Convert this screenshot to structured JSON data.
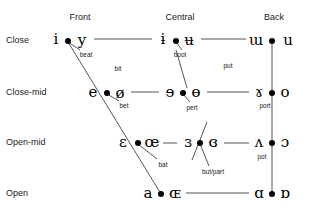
{
  "chart_data": {
    "type": "scatter",
    "xlabel": "",
    "ylabel": "",
    "columns": [
      "Front",
      "Central",
      "Back"
    ],
    "rows": [
      "Close",
      "Close-mid",
      "Open-mid",
      "Open"
    ],
    "points": [
      {
        "row": "Close",
        "column": "Front",
        "unrounded": "i",
        "rounded": "y",
        "gloss": "beat"
      },
      {
        "row": "Close",
        "column": "Central",
        "unrounded": "ɨ",
        "rounded": "ʉ",
        "gloss": "boot"
      },
      {
        "row": "Close",
        "column": "Back",
        "unrounded": "ɯ",
        "rounded": "u",
        "gloss": "put"
      },
      {
        "row": "Close-mid",
        "column": "Front",
        "unrounded": "e",
        "rounded": "ø",
        "gloss": "bet"
      },
      {
        "row": "Close-mid",
        "column": "Central",
        "unrounded": "ɘ",
        "rounded": "ɵ",
        "gloss": "pert"
      },
      {
        "row": "Close-mid",
        "column": "Back",
        "unrounded": "ɤ",
        "rounded": "o",
        "gloss": "port"
      },
      {
        "row": "Open-mid",
        "column": "Front",
        "unrounded": "ɛ",
        "rounded": "œ",
        "gloss": "bat"
      },
      {
        "row": "Open-mid",
        "column": "Central",
        "unrounded": "ɜ",
        "rounded": "ɞ",
        "gloss": "but/part"
      },
      {
        "row": "Open-mid",
        "column": "Back",
        "unrounded": "ʌ",
        "rounded": "ɔ",
        "gloss": "pot"
      },
      {
        "row": "Open",
        "column": "Front",
        "unrounded": "a",
        "rounded": "ɶ",
        "gloss": ""
      },
      {
        "row": "Open",
        "column": "Back",
        "unrounded": "ɑ",
        "rounded": "ɒ",
        "gloss": ""
      }
    ],
    "extra_glosses": [
      "bit"
    ]
  },
  "column_headers": [
    {
      "label": "Front",
      "x": 80,
      "y": 12
    },
    {
      "label": "Central",
      "x": 180,
      "y": 12
    },
    {
      "label": "Back",
      "x": 274,
      "y": 12
    }
  ],
  "row_headers": [
    {
      "label": "Close",
      "x": 6,
      "y": 40
    },
    {
      "label": "Close-mid",
      "x": 6,
      "y": 92
    },
    {
      "label": "Open-mid",
      "x": 6,
      "y": 142
    },
    {
      "label": "Open",
      "x": 6,
      "y": 193
    }
  ],
  "vowels": [
    {
      "glyph": "i",
      "x": 56,
      "y": 39,
      "name": "vowel-close-front-unrounded"
    },
    {
      "glyph": "y",
      "x": 82,
      "y": 40,
      "name": "vowel-close-front-rounded"
    },
    {
      "glyph": "ɨ",
      "x": 163,
      "y": 39,
      "name": "vowel-close-central-unrounded"
    },
    {
      "glyph": "ʉ",
      "x": 189,
      "y": 40,
      "name": "vowel-close-central-rounded"
    },
    {
      "glyph": "ɯ",
      "x": 256,
      "y": 40,
      "name": "vowel-close-back-unrounded"
    },
    {
      "glyph": "u",
      "x": 288,
      "y": 40,
      "name": "vowel-close-back-rounded"
    },
    {
      "glyph": "e",
      "x": 93,
      "y": 92,
      "name": "vowel-closemid-front-unrounded"
    },
    {
      "glyph": "ø",
      "x": 120,
      "y": 93,
      "name": "vowel-closemid-front-rounded"
    },
    {
      "glyph": "ɘ",
      "x": 170,
      "y": 92,
      "name": "vowel-closemid-central-unrounded"
    },
    {
      "glyph": "ɵ",
      "x": 196,
      "y": 92,
      "name": "vowel-closemid-central-rounded"
    },
    {
      "glyph": "ɤ",
      "x": 259,
      "y": 92,
      "name": "vowel-closemid-back-unrounded"
    },
    {
      "glyph": "o",
      "x": 285,
      "y": 92,
      "name": "vowel-closemid-back-rounded"
    },
    {
      "glyph": "ɛ",
      "x": 123,
      "y": 142,
      "name": "vowel-openmid-front-unrounded"
    },
    {
      "glyph": "œ",
      "x": 152,
      "y": 142,
      "name": "vowel-openmid-front-rounded"
    },
    {
      "glyph": "ɜ",
      "x": 188,
      "y": 142,
      "name": "vowel-openmid-central-unrounded"
    },
    {
      "glyph": "ɞ",
      "x": 213,
      "y": 142,
      "name": "vowel-openmid-central-rounded"
    },
    {
      "glyph": "ʌ",
      "x": 259,
      "y": 142,
      "name": "vowel-openmid-back-unrounded"
    },
    {
      "glyph": "ɔ",
      "x": 285,
      "y": 142,
      "name": "vowel-openmid-back-rounded"
    },
    {
      "glyph": "a",
      "x": 148,
      "y": 193,
      "name": "vowel-open-front-unrounded"
    },
    {
      "glyph": "ɶ",
      "x": 175,
      "y": 193,
      "name": "vowel-open-front-rounded"
    },
    {
      "glyph": "ɑ",
      "x": 259,
      "y": 193,
      "name": "vowel-open-back-unrounded"
    },
    {
      "glyph": "ɒ",
      "x": 285,
      "y": 193,
      "name": "vowel-open-back-rounded"
    }
  ],
  "dots": [
    {
      "x": 68,
      "y": 41,
      "name": "dot-close-front"
    },
    {
      "x": 176,
      "y": 41,
      "name": "dot-close-central"
    },
    {
      "x": 272,
      "y": 41,
      "name": "dot-close-back"
    },
    {
      "x": 107,
      "y": 93,
      "name": "dot-closemid-front"
    },
    {
      "x": 183,
      "y": 93,
      "name": "dot-closemid-central"
    },
    {
      "x": 272,
      "y": 93,
      "name": "dot-closemid-back"
    },
    {
      "x": 138,
      "y": 143,
      "name": "dot-openmid-front"
    },
    {
      "x": 200,
      "y": 143,
      "name": "dot-openmid-central"
    },
    {
      "x": 272,
      "y": 143,
      "name": "dot-openmid-back"
    },
    {
      "x": 161,
      "y": 194,
      "name": "dot-open-front"
    },
    {
      "x": 272,
      "y": 194,
      "name": "dot-open-back"
    }
  ],
  "glosses": [
    {
      "text": "beat",
      "x": 86,
      "y": 54,
      "name": "gloss-beat"
    },
    {
      "text": "bit",
      "x": 118,
      "y": 68,
      "name": "gloss-bit"
    },
    {
      "text": "boot",
      "x": 180,
      "y": 54,
      "name": "gloss-boot"
    },
    {
      "text": "put",
      "x": 228,
      "y": 65,
      "name": "gloss-put"
    },
    {
      "text": "bet",
      "x": 124,
      "y": 105,
      "name": "gloss-bet"
    },
    {
      "text": "pert",
      "x": 192,
      "y": 107,
      "name": "gloss-pert"
    },
    {
      "text": "port",
      "x": 265,
      "y": 105,
      "name": "gloss-port"
    },
    {
      "text": "bat",
      "x": 163,
      "y": 164,
      "name": "gloss-bat"
    },
    {
      "text": "but/part",
      "x": 213,
      "y": 171,
      "name": "gloss-but-part"
    },
    {
      "text": "pot",
      "x": 262,
      "y": 156,
      "name": "gloss-pot"
    }
  ],
  "lines": {
    "color": "#555555",
    "width": 1,
    "segments": [
      {
        "x1": 94,
        "y1": 39,
        "x2": 152,
        "y2": 39,
        "name": "line-close-front-to-central"
      },
      {
        "x1": 201,
        "y1": 39,
        "x2": 246,
        "y2": 39,
        "name": "line-close-central-to-back"
      },
      {
        "x1": 131,
        "y1": 92,
        "x2": 159,
        "y2": 92,
        "name": "line-closemid-front-to-central"
      },
      {
        "x1": 207,
        "y1": 92,
        "x2": 249,
        "y2": 92,
        "name": "line-closemid-central-to-back"
      },
      {
        "x1": 163,
        "y1": 143,
        "x2": 177,
        "y2": 143,
        "name": "line-openmid-front-to-central"
      },
      {
        "x1": 224,
        "y1": 143,
        "x2": 249,
        "y2": 143,
        "name": "line-openmid-central-to-back"
      },
      {
        "x1": 186,
        "y1": 193,
        "x2": 249,
        "y2": 193,
        "name": "line-open-front-to-back"
      },
      {
        "x1": 68,
        "y1": 42,
        "x2": 161,
        "y2": 194,
        "name": "line-front-diagonal"
      },
      {
        "x1": 272,
        "y1": 41,
        "x2": 272,
        "y2": 194,
        "name": "line-back-vertical"
      }
    ],
    "leaders": [
      {
        "x1": 68,
        "y1": 42,
        "x2": 80,
        "y2": 50,
        "name": "leader-beat"
      },
      {
        "x1": 176,
        "y1": 42,
        "x2": 182,
        "y2": 50,
        "name": "leader-boot"
      },
      {
        "x1": 107,
        "y1": 94,
        "x2": 119,
        "y2": 101,
        "name": "leader-bet"
      },
      {
        "x1": 183,
        "y1": 94,
        "x2": 190,
        "y2": 102,
        "name": "leader-pert"
      },
      {
        "x1": 138,
        "y1": 144,
        "x2": 157,
        "y2": 159,
        "name": "leader-bat"
      },
      {
        "x1": 200,
        "y1": 144,
        "x2": 209,
        "y2": 166,
        "name": "leader-but-part"
      },
      {
        "x1": 176,
        "y1": 50,
        "x2": 187,
        "y2": 88,
        "name": "leader-central-upper"
      },
      {
        "x1": 207,
        "y1": 122,
        "x2": 192,
        "y2": 160,
        "name": "leader-central-lower"
      }
    ]
  }
}
